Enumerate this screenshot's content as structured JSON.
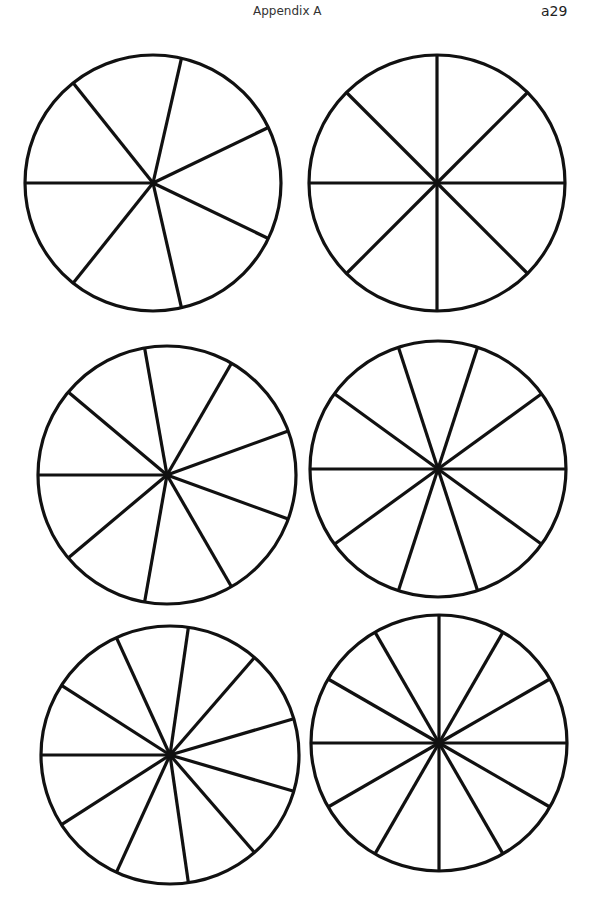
{
  "header": {
    "title": "Appendix A",
    "page_number": "a29"
  },
  "style": {
    "stroke_color": "#111111",
    "stroke_width": 3.2,
    "fill": "#ffffff"
  },
  "circles": [
    {
      "id": "circle-7-parts",
      "sections": 7,
      "cx": 153,
      "cy": 183,
      "r": 128,
      "start_angle_deg": 180
    },
    {
      "id": "circle-8-parts",
      "sections": 8,
      "cx": 437,
      "cy": 183,
      "r": 128,
      "start_angle_deg": 180
    },
    {
      "id": "circle-9-parts",
      "sections": 9,
      "cx": 167,
      "cy": 475,
      "r": 129,
      "start_angle_deg": 180
    },
    {
      "id": "circle-10-parts",
      "sections": 10,
      "cx": 438,
      "cy": 469,
      "r": 128,
      "start_angle_deg": 180
    },
    {
      "id": "circle-11-parts",
      "sections": 11,
      "cx": 170,
      "cy": 755,
      "r": 129,
      "start_angle_deg": 180
    },
    {
      "id": "circle-12-parts",
      "sections": 12,
      "cx": 439,
      "cy": 743,
      "r": 128,
      "start_angle_deg": 180
    }
  ]
}
